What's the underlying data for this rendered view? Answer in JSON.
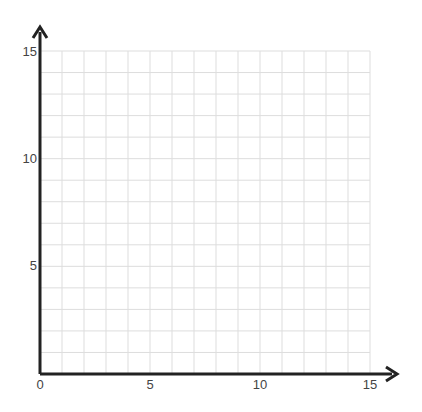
{
  "chart_data": {
    "type": "scatter",
    "title": "",
    "xlabel": "",
    "ylabel": "",
    "xlim": [
      0,
      15
    ],
    "ylim": [
      0,
      15
    ],
    "grid": true,
    "grid_step": 1,
    "x_ticks": [
      0,
      5,
      10,
      15
    ],
    "y_ticks": [
      5,
      10,
      15
    ],
    "x_tick_labels": [
      "0",
      "5",
      "10",
      "15"
    ],
    "y_tick_labels": [
      "5",
      "10",
      "15"
    ],
    "series": [],
    "legend": null,
    "colors": {
      "axis": "#222222",
      "grid": "#dddddd",
      "label": "#444444"
    }
  }
}
